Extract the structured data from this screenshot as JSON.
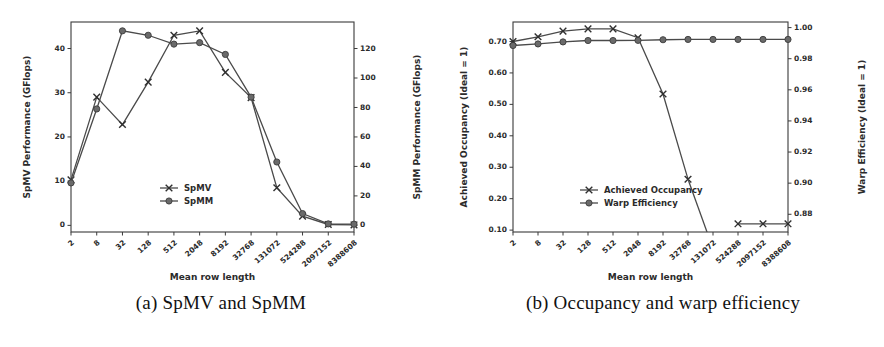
{
  "figure": {
    "subfigures": [
      {
        "id": "a",
        "caption": "(a) SpMV and SpMM",
        "chart_index": 0
      },
      {
        "id": "b",
        "caption": "(b) Occupancy and warp efficiency",
        "chart_index": 1
      }
    ]
  },
  "chart_data": [
    {
      "type": "line",
      "title": "",
      "xlabel": "Mean row length",
      "ylabel": "SpMV Performance (GFlops)",
      "y2label": "SpMM Performance (GFlops)",
      "xscale": "log2-categorical",
      "categories": [
        "2",
        "8",
        "32",
        "128",
        "512",
        "2048",
        "8192",
        "32768",
        "131072",
        "524288",
        "2097152",
        "8388608"
      ],
      "xticklabels": [
        "2",
        "8",
        "32",
        "128",
        "512",
        "2048",
        "8192",
        "32768",
        "131072",
        "524288",
        "2097152",
        "8388608"
      ],
      "yticklabels": [
        "0",
        "10",
        "20",
        "30",
        "40"
      ],
      "ylim": [
        -1.5,
        46
      ],
      "yticks": [
        0,
        10,
        20,
        30,
        40
      ],
      "y2ticklabels": [
        "0",
        "20",
        "40",
        "60",
        "80",
        "100",
        "120"
      ],
      "y2lim": [
        -4.5,
        138
      ],
      "y2ticks": [
        0,
        20,
        40,
        60,
        80,
        100,
        120
      ],
      "grid": false,
      "legend_position": "lower center",
      "series": [
        {
          "name": "SpMV",
          "marker": "x",
          "axis": "left",
          "values": [
            10.3,
            29.0,
            22.8,
            32.4,
            43.0,
            44.0,
            34.6,
            28.9,
            8.5,
            2.1,
            0.2,
            0.1
          ]
        },
        {
          "name": "SpMM",
          "marker": "o",
          "axis": "right",
          "values": [
            28.8,
            79.0,
            132.0,
            129.0,
            123.0,
            124.0,
            116.0,
            87.0,
            43.0,
            8.0,
            1.0,
            0.8
          ]
        }
      ]
    },
    {
      "type": "line",
      "title": "",
      "xlabel": "Mean row length",
      "ylabel": "Achieved Occupancy (Ideal = 1)",
      "y2label": "Warp Efficiency (Ideal = 1)",
      "xscale": "log2-categorical",
      "categories": [
        "2",
        "8",
        "32",
        "128",
        "512",
        "2048",
        "8192",
        "32768",
        "131072",
        "524288",
        "2097152",
        "8388608"
      ],
      "xticklabels": [
        "2",
        "8",
        "32",
        "128",
        "512",
        "2048",
        "8192",
        "32768",
        "131072",
        "524288",
        "2097152",
        "8388608"
      ],
      "yticklabels": [
        "0.10",
        "0.20",
        "0.30",
        "0.40",
        "0.50",
        "0.60",
        "0.70"
      ],
      "ylim": [
        0.094,
        0.762
      ],
      "yticks": [
        0.1,
        0.2,
        0.3,
        0.4,
        0.5,
        0.6,
        0.7
      ],
      "y2ticklabels": [
        "0.88",
        "0.90",
        "0.92",
        "0.94",
        "0.96",
        "0.98",
        "1.00"
      ],
      "y2lim": [
        0.8686,
        1.0036
      ],
      "y2ticks": [
        0.88,
        0.9,
        0.92,
        0.94,
        0.96,
        0.98,
        1.0
      ],
      "grid": false,
      "legend_position": "lower center",
      "series": [
        {
          "name": "Achieved Occupancy",
          "marker": "x",
          "axis": "left",
          "values": [
            0.7,
            0.715,
            0.733,
            0.74,
            0.74,
            0.712,
            0.533,
            0.262,
            null,
            0.12,
            0.12,
            0.12
          ]
        },
        {
          "name": "Warp Efficiency",
          "marker": "o",
          "axis": "right",
          "values": [
            0.9885,
            0.9895,
            0.9908,
            0.9917,
            0.9917,
            0.9918,
            0.9922,
            0.9924,
            0.9924,
            0.9924,
            0.9924,
            0.9924
          ]
        }
      ]
    }
  ],
  "colors": {
    "line": "#4a4a4a",
    "marker_fill": "#6a6a6a",
    "marker_stroke": "#3c3c3c",
    "axis": "#3a3a3a",
    "background": "#ffffff",
    "text": "#2b2b2b"
  }
}
